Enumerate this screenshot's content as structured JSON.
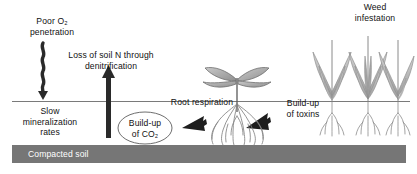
{
  "figure": {
    "type": "annotated-diagram",
    "background_color": "#ffffff",
    "text_color": "#111111"
  },
  "labels": {
    "poor_oxygen": "Poor O₂\npenetration",
    "loss_of_n": "Loss of soil N through\ndenitrification",
    "slow_mineralization": "Slow\nmineralization\nrates",
    "build_up_co2": "Build-up\nof CO₂",
    "root_respiration": "Root respiration",
    "build_up_toxins": "Build-up\nof toxins",
    "weed_infestation": "Weed\ninfestation",
    "compacted_soil": "Compacted soil"
  },
  "layers": {
    "soil_surface_line": {
      "name": "soil-surface-line",
      "y": 101,
      "x_start": 12,
      "x_end": 410,
      "color": "#7a7a7a"
    },
    "compacted_band": {
      "name": "compacted-soil-band",
      "x": 12,
      "y": 145,
      "width": 394,
      "height": 18,
      "fill": "#767676",
      "label_color": "#ffffff"
    }
  },
  "arrows": [
    {
      "name": "wavy-arrow-oxygen-down",
      "direction": "down",
      "style": "wavy",
      "color": "#2a2a2a",
      "meaning": "Poor O2 penetration into soil"
    },
    {
      "name": "arrow-denitrification-up",
      "direction": "up",
      "style": "straight-thick",
      "color": "#2a2a2a",
      "meaning": "Loss of soil N through denitrification"
    },
    {
      "name": "arrow-root-respiration-left",
      "direction": "left",
      "style": "tapered-block",
      "color": "#1e1e1e",
      "meaning": "Root respiration releases CO2"
    },
    {
      "name": "arrow-toxins-right",
      "direction": "right",
      "style": "tapered-block",
      "color": "#1e1e1e",
      "meaning": "Build-up of toxins around roots"
    }
  ],
  "illustrations": [
    {
      "name": "crop-seedling",
      "description": "Stunted crop seedling with two pairs of opposite leaves and a shallow fibrous root system above the compacted layer",
      "leaf_fill": "#9a9a9a",
      "stem_color": "#555555",
      "root_color": "#777777"
    },
    {
      "name": "weed-clump-group",
      "count": 3,
      "description": "Three grass-like weed clumps with shallow roots",
      "leaf_fill": "#b0b0b0",
      "stem_color": "#8a8a8a",
      "root_color": "#8a8a8a"
    },
    {
      "name": "co2-bubble-ellipse",
      "description": "Ellipse outline enclosing the Build-up of CO2 label",
      "stroke": "#6e6e6e"
    }
  ]
}
